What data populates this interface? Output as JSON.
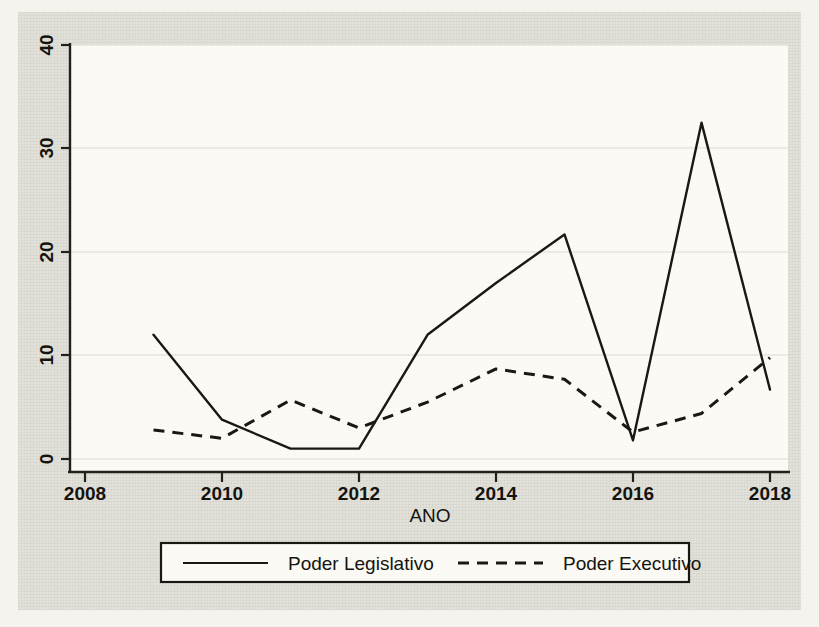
{
  "chart_data": {
    "type": "line",
    "title": "",
    "xlabel": "ANO",
    "ylabel": "",
    "x": [
      2009,
      2010,
      2011,
      2012,
      2013,
      2014,
      2015,
      2016,
      2017,
      2018
    ],
    "xlim": [
      2008,
      2018
    ],
    "ylim": [
      0,
      40
    ],
    "xticks": [
      "2008",
      "2010",
      "2012",
      "2014",
      "2016",
      "2018"
    ],
    "xtick_values": [
      2008,
      2010,
      2012,
      2014,
      2016,
      2018
    ],
    "yticks": [
      "0",
      "10",
      "20",
      "30",
      "40"
    ],
    "ytick_values": [
      0,
      10,
      20,
      30,
      40
    ],
    "grid": true,
    "legend_position": "bottom",
    "series": [
      {
        "name": "Poder Legislativo",
        "style": "solid",
        "values": [
          12,
          3.8,
          1,
          1,
          12,
          17,
          21.7,
          1.8,
          32.5,
          6.7
        ]
      },
      {
        "name": "Poder Executivo",
        "style": "dashed",
        "values": [
          2.8,
          2,
          5.7,
          3,
          5.5,
          8.7,
          7.7,
          2.6,
          4.4,
          9.8
        ]
      }
    ]
  },
  "legend": {
    "entries": [
      {
        "label": "Poder Legislativo",
        "style": "solid"
      },
      {
        "label": "Poder Executivo",
        "style": "dashed"
      }
    ]
  },
  "colors": {
    "line": "#1a1814",
    "grid": "#dedcd2",
    "plot_background": "#fbfaf4",
    "page_background": "#e3e2da"
  }
}
